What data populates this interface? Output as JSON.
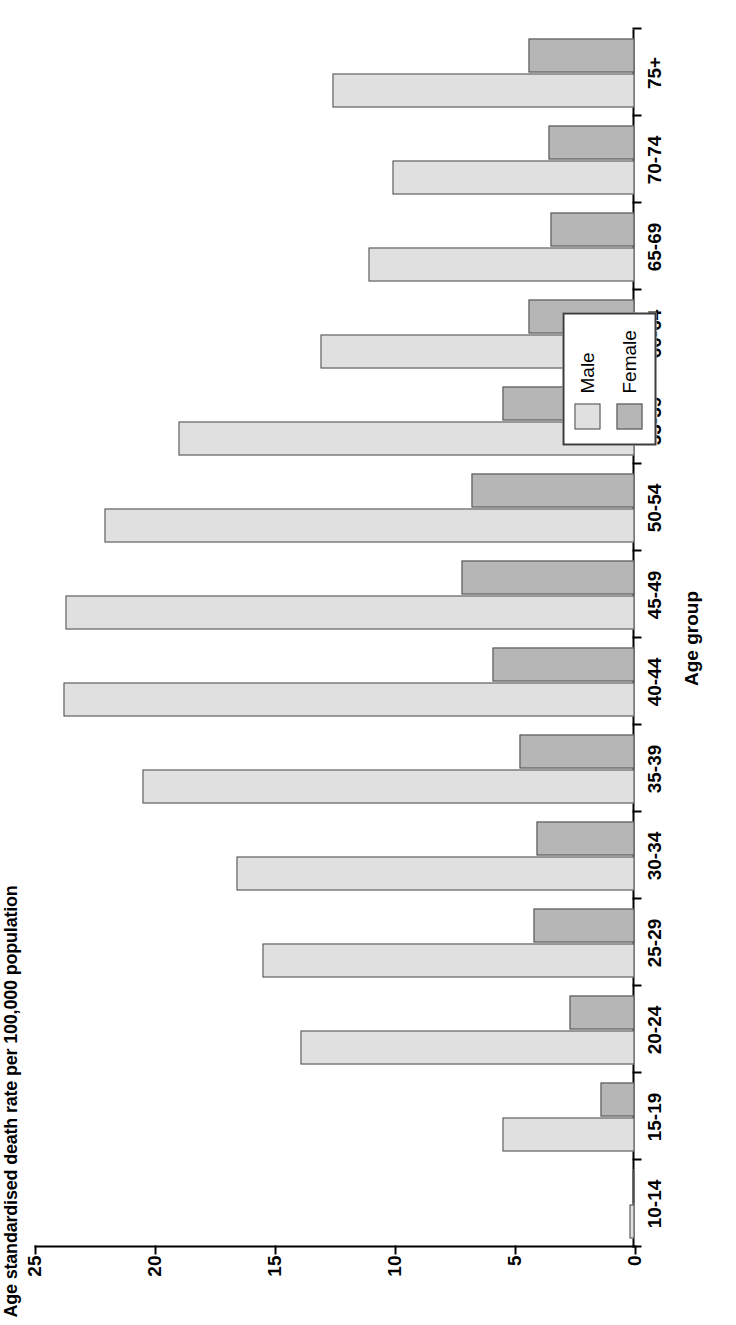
{
  "chart_data": {
    "type": "bar",
    "orientation": "rotated-90",
    "title": "",
    "ylabel": "Age standardised death rate per 100,000 population",
    "xlabel": "Age group",
    "categories": [
      "10-14",
      "15-19",
      "20-24",
      "25-29",
      "30-34",
      "35-39",
      "40-44",
      "45-49",
      "50-54",
      "55-59",
      "60-64",
      "65-69",
      "70-74",
      "75+"
    ],
    "ylim": [
      0,
      25
    ],
    "yticks": [
      0,
      5,
      10,
      15,
      20,
      25
    ],
    "grid": false,
    "legend_position": "bottom-right",
    "series": [
      {
        "name": "Male",
        "color": "#e0e0e0",
        "values": [
          0.2,
          5.5,
          13.9,
          15.5,
          16.6,
          20.5,
          23.8,
          23.7,
          22.1,
          19.0,
          13.1,
          11.1,
          10.1,
          12.6
        ]
      },
      {
        "name": "Female",
        "color": "#b6b6b6",
        "values": [
          0.1,
          1.4,
          2.7,
          4.2,
          4.1,
          4.8,
          5.9,
          7.2,
          6.8,
          5.5,
          4.4,
          3.5,
          3.6,
          4.4
        ]
      }
    ]
  },
  "legend": {
    "items": [
      {
        "label": "Male",
        "color": "#e0e0e0"
      },
      {
        "label": "Female",
        "color": "#b6b6b6"
      }
    ]
  }
}
